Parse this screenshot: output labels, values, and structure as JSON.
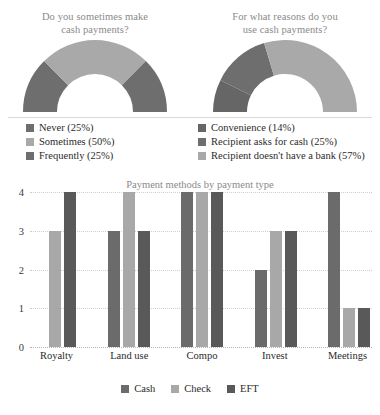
{
  "donuts": [
    {
      "title_line1": "Do you sometimes make",
      "title_line2": "cash payments?",
      "legend": [
        {
          "label": "Never (25%)",
          "color": "#6e6e6e",
          "value": 25
        },
        {
          "label": "Sometimes (50%)",
          "color": "#a9a9a9",
          "value": 50
        },
        {
          "label": "Frequently (25%)",
          "color": "#6e6e6e",
          "value": 25
        }
      ]
    },
    {
      "title_line1": "For what reasons do you",
      "title_line2": "use cash payments?",
      "legend": [
        {
          "label": "Convenience (14%)",
          "color": "#666666",
          "value": 14
        },
        {
          "label": "Recipient asks for cash (25%)",
          "color": "#6e6e6e",
          "value": 25
        },
        {
          "label": "Recipient doesn't have a bank (57%)",
          "color": "#a9a9a9",
          "value": 57
        }
      ]
    }
  ],
  "chart_data": [
    {
      "type": "pie",
      "title": "Do you sometimes make cash payments?",
      "labels": [
        "Never",
        "Sometimes",
        "Frequently"
      ],
      "values": [
        25,
        50,
        25
      ],
      "colors": [
        "#6e6e6e",
        "#a9a9a9",
        "#6e6e6e"
      ],
      "legend_position": "bottom",
      "note": "half-donut gauge, percentages of 100"
    },
    {
      "type": "pie",
      "title": "For what reasons do you use cash payments?",
      "labels": [
        "Convenience",
        "Recipient asks for cash",
        "Recipient doesn't have a bank"
      ],
      "values": [
        14,
        25,
        57
      ],
      "colors": [
        "#666666",
        "#6e6e6e",
        "#a9a9a9"
      ],
      "legend_position": "bottom",
      "note": "half-donut gauge, percentages of 100"
    },
    {
      "type": "bar",
      "title": "Payment methods by payment type",
      "categories": [
        "Royalty",
        "Land use",
        "Compo",
        "Invest",
        "Meetings"
      ],
      "series": [
        {
          "name": "Cash",
          "color": "#6b6b6b",
          "values": [
            0,
            3,
            4,
            2,
            4
          ]
        },
        {
          "name": "Check",
          "color": "#a8a8a8",
          "values": [
            3,
            4,
            4,
            3,
            1
          ]
        },
        {
          "name": "EFT",
          "color": "#595959",
          "values": [
            4,
            3,
            4,
            3,
            1
          ]
        }
      ],
      "xlabel": "",
      "ylabel": "",
      "ylim": [
        0,
        4
      ],
      "yticks": [
        0,
        1,
        2,
        3,
        4
      ],
      "grid": true,
      "legend_position": "bottom"
    }
  ]
}
